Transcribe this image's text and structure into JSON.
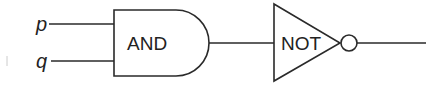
{
  "diagram": {
    "type": "logic-circuit",
    "inputs": [
      {
        "label": "p"
      },
      {
        "label": "q"
      }
    ],
    "gates": [
      {
        "type": "AND",
        "label": "AND"
      },
      {
        "type": "NOT",
        "label": "NOT"
      }
    ],
    "colors": {
      "line": "#2a2a2a",
      "background": "#ffffff"
    }
  }
}
